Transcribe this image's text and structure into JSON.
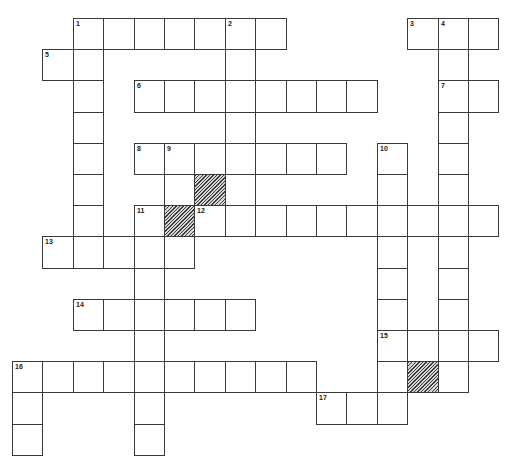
{
  "puzzle": {
    "title": "",
    "grid": {
      "cols": 16,
      "rows": 14,
      "origin_x": 12,
      "origin_y": 18,
      "cell_w": 30.4,
      "cell_h": 31.2,
      "line_color": "#3a3a3a",
      "shade_color": "#3c3c3c"
    },
    "cells": [
      {
        "r": 0,
        "c": 2,
        "n": "1"
      },
      {
        "r": 0,
        "c": 3
      },
      {
        "r": 0,
        "c": 4
      },
      {
        "r": 0,
        "c": 5
      },
      {
        "r": 0,
        "c": 6
      },
      {
        "r": 0,
        "c": 7,
        "n": "2"
      },
      {
        "r": 0,
        "c": 8
      },
      {
        "r": 0,
        "c": 13,
        "n": "3"
      },
      {
        "r": 0,
        "c": 14,
        "n": "4"
      },
      {
        "r": 0,
        "c": 15
      },
      {
        "r": 1,
        "c": 1,
        "n": "5"
      },
      {
        "r": 1,
        "c": 2
      },
      {
        "r": 1,
        "c": 7
      },
      {
        "r": 1,
        "c": 14
      },
      {
        "r": 2,
        "c": 2
      },
      {
        "r": 2,
        "c": 4,
        "n": "6"
      },
      {
        "r": 2,
        "c": 5
      },
      {
        "r": 2,
        "c": 6
      },
      {
        "r": 2,
        "c": 7
      },
      {
        "r": 2,
        "c": 8
      },
      {
        "r": 2,
        "c": 9
      },
      {
        "r": 2,
        "c": 10
      },
      {
        "r": 2,
        "c": 11
      },
      {
        "r": 2,
        "c": 14,
        "n": "7"
      },
      {
        "r": 2,
        "c": 15
      },
      {
        "r": 3,
        "c": 2
      },
      {
        "r": 3,
        "c": 7
      },
      {
        "r": 3,
        "c": 14
      },
      {
        "r": 4,
        "c": 2
      },
      {
        "r": 4,
        "c": 4,
        "n": "8"
      },
      {
        "r": 4,
        "c": 5,
        "n": "9"
      },
      {
        "r": 4,
        "c": 6
      },
      {
        "r": 4,
        "c": 7
      },
      {
        "r": 4,
        "c": 8
      },
      {
        "r": 4,
        "c": 9
      },
      {
        "r": 4,
        "c": 10
      },
      {
        "r": 4,
        "c": 12,
        "n": "10"
      },
      {
        "r": 4,
        "c": 14
      },
      {
        "r": 5,
        "c": 2
      },
      {
        "r": 5,
        "c": 5
      },
      {
        "r": 5,
        "c": 6,
        "shaded": true
      },
      {
        "r": 5,
        "c": 7
      },
      {
        "r": 5,
        "c": 12
      },
      {
        "r": 5,
        "c": 14
      },
      {
        "r": 6,
        "c": 2
      },
      {
        "r": 6,
        "c": 4,
        "n": "11"
      },
      {
        "r": 6,
        "c": 5,
        "shaded": true
      },
      {
        "r": 6,
        "c": 6,
        "n": "12"
      },
      {
        "r": 6,
        "c": 7
      },
      {
        "r": 6,
        "c": 8
      },
      {
        "r": 6,
        "c": 9
      },
      {
        "r": 6,
        "c": 10
      },
      {
        "r": 6,
        "c": 11
      },
      {
        "r": 6,
        "c": 12
      },
      {
        "r": 6,
        "c": 13
      },
      {
        "r": 6,
        "c": 14
      },
      {
        "r": 6,
        "c": 15
      },
      {
        "r": 7,
        "c": 1,
        "n": "13"
      },
      {
        "r": 7,
        "c": 2
      },
      {
        "r": 7,
        "c": 3
      },
      {
        "r": 7,
        "c": 4
      },
      {
        "r": 7,
        "c": 5
      },
      {
        "r": 7,
        "c": 12
      },
      {
        "r": 7,
        "c": 14
      },
      {
        "r": 8,
        "c": 4
      },
      {
        "r": 8,
        "c": 12
      },
      {
        "r": 8,
        "c": 14
      },
      {
        "r": 9,
        "c": 2,
        "n": "14"
      },
      {
        "r": 9,
        "c": 3
      },
      {
        "r": 9,
        "c": 4
      },
      {
        "r": 9,
        "c": 5
      },
      {
        "r": 9,
        "c": 6
      },
      {
        "r": 9,
        "c": 7
      },
      {
        "r": 9,
        "c": 12
      },
      {
        "r": 9,
        "c": 14
      },
      {
        "r": 10,
        "c": 4
      },
      {
        "r": 10,
        "c": 12,
        "n": "15"
      },
      {
        "r": 10,
        "c": 13
      },
      {
        "r": 10,
        "c": 14
      },
      {
        "r": 10,
        "c": 15
      },
      {
        "r": 11,
        "c": 0,
        "n": "16"
      },
      {
        "r": 11,
        "c": 1
      },
      {
        "r": 11,
        "c": 2
      },
      {
        "r": 11,
        "c": 3
      },
      {
        "r": 11,
        "c": 4
      },
      {
        "r": 11,
        "c": 5
      },
      {
        "r": 11,
        "c": 6
      },
      {
        "r": 11,
        "c": 7
      },
      {
        "r": 11,
        "c": 8
      },
      {
        "r": 11,
        "c": 9
      },
      {
        "r": 11,
        "c": 12
      },
      {
        "r": 11,
        "c": 13,
        "shaded": true
      },
      {
        "r": 11,
        "c": 14
      },
      {
        "r": 12,
        "c": 0
      },
      {
        "r": 12,
        "c": 4
      },
      {
        "r": 12,
        "c": 10,
        "n": "17"
      },
      {
        "r": 12,
        "c": 11
      },
      {
        "r": 12,
        "c": 12
      },
      {
        "r": 13,
        "c": 0
      },
      {
        "r": 13,
        "c": 4
      }
    ]
  }
}
